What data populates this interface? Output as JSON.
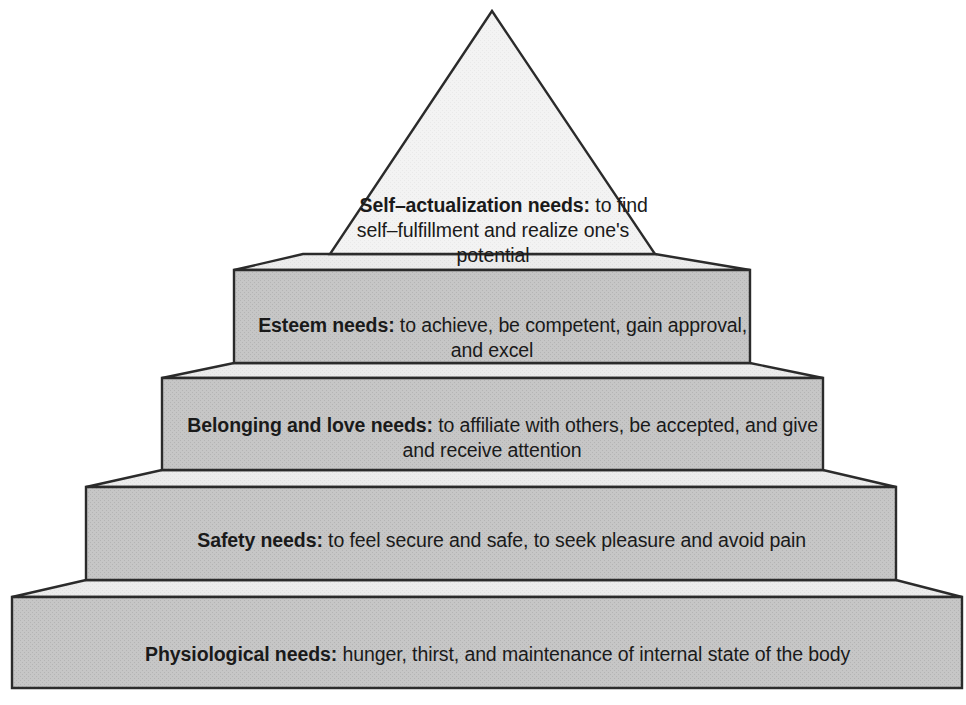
{
  "diagram": {
    "type": "pyramid",
    "orientation": "apex-top",
    "tier_count": 5,
    "background_color": "#ffffff",
    "stroke_color": "#2b2b2b",
    "front_face_color": "#c6c6c6",
    "top_face_color": "#ebebeb",
    "apex_face_color": "#f2f2f2",
    "text_color": "#1a1a1a"
  },
  "tiers": [
    {
      "id": "self-actualization",
      "level": 5,
      "position": "top",
      "shape": "triangle",
      "bold_lead": "Self–actualization needs:",
      "body": " to find self–fulfillment and realize one's potential",
      "full_text": "Self–actualization needs: to find self–fulfillment and realize one's potential",
      "lines": [
        "Self–actualization needs:",
        "to find self–fulfillment and",
        "realize one's potential"
      ]
    },
    {
      "id": "esteem",
      "level": 4,
      "position": "second",
      "shape": "slab",
      "bold_lead": "Esteem needs:",
      "body": " to achieve, be competent, gain approval, and excel",
      "full_text": "Esteem needs: to achieve, be competent, gain approval, and excel",
      "lines": [
        "Esteem needs: to achieve, be",
        "competent, gain approval, and excel"
      ]
    },
    {
      "id": "belonging-and-love",
      "level": 3,
      "position": "third",
      "shape": "slab",
      "bold_lead": "Belonging and love needs:",
      "body": " to affiliate with others, be accepted, and give and receive attention",
      "full_text": "Belonging and love needs: to affiliate with others, be accepted, and give and receive attention",
      "lines": [
        "Belonging and love needs: to affiliate",
        "with others, be accepted, and give and",
        "receive attention"
      ]
    },
    {
      "id": "safety",
      "level": 2,
      "position": "fourth",
      "shape": "slab",
      "bold_lead": "Safety needs:",
      "body": " to feel secure and safe, to seek pleasure and avoid pain",
      "full_text": "Safety needs: to feel secure and safe, to seek pleasure and avoid pain",
      "lines": [
        "Safety needs: to feel secure and safe, to",
        "seek pleasure and avoid pain"
      ]
    },
    {
      "id": "physiological",
      "level": 1,
      "position": "base",
      "shape": "slab",
      "bold_lead": "Physiological needs:",
      "body": " hunger, thirst, and maintenance of internal state of the body",
      "full_text": "Physiological needs: hunger, thirst, and maintenance of internal state of the body",
      "lines": [
        "Physiological needs: hunger, thirst, and maintenance",
        "of internal state of the body"
      ]
    }
  ]
}
